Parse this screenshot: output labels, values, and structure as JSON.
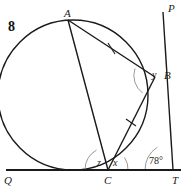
{
  "figure": {
    "problem_number": "8",
    "type": "circle-geometry-diagram",
    "background_color": "#ffffff",
    "stroke_color": "#1a1a1a",
    "arc_color": "#8a8a8a",
    "points": {
      "A": {
        "label": "A",
        "x": 68,
        "y": 20
      },
      "B": {
        "label": "B",
        "x": 155,
        "y": 77
      },
      "C": {
        "label": "C",
        "x": 108,
        "y": 170
      },
      "P": {
        "label": "P",
        "x": 166,
        "y": 14
      },
      "Q": {
        "label": "Q",
        "x": 8,
        "y": 170
      },
      "T": {
        "label": "T",
        "x": 173,
        "y": 170
      }
    },
    "circle": {
      "center_x": 73,
      "center_y": 95,
      "radius": 75
    },
    "angles": [
      {
        "name": "x",
        "label": "x",
        "vertex": "C",
        "between": "CB and CT"
      },
      {
        "name": "z",
        "label": "z",
        "vertex": "C",
        "between": "CQ and CA"
      },
      {
        "name": "y",
        "label": "y",
        "vertex": "B",
        "between": "BA and BC"
      },
      {
        "name": "angle-T",
        "label": "78°",
        "vertex": "T",
        "between": "TC and TP"
      }
    ],
    "segments": [
      {
        "name": "chord-AB",
        "from": "A",
        "to": "B",
        "tick_marks": 1
      },
      {
        "name": "chord-CB",
        "from": "C",
        "to": "B",
        "tick_marks": 1
      },
      {
        "name": "chord-AC",
        "from": "A",
        "to": "C",
        "tick_marks": 0
      },
      {
        "name": "line-QT",
        "from": "Q",
        "to": "T",
        "tick_marks": 0
      },
      {
        "name": "line-PT",
        "from": "P",
        "to": "T",
        "tick_marks": 0
      }
    ]
  }
}
